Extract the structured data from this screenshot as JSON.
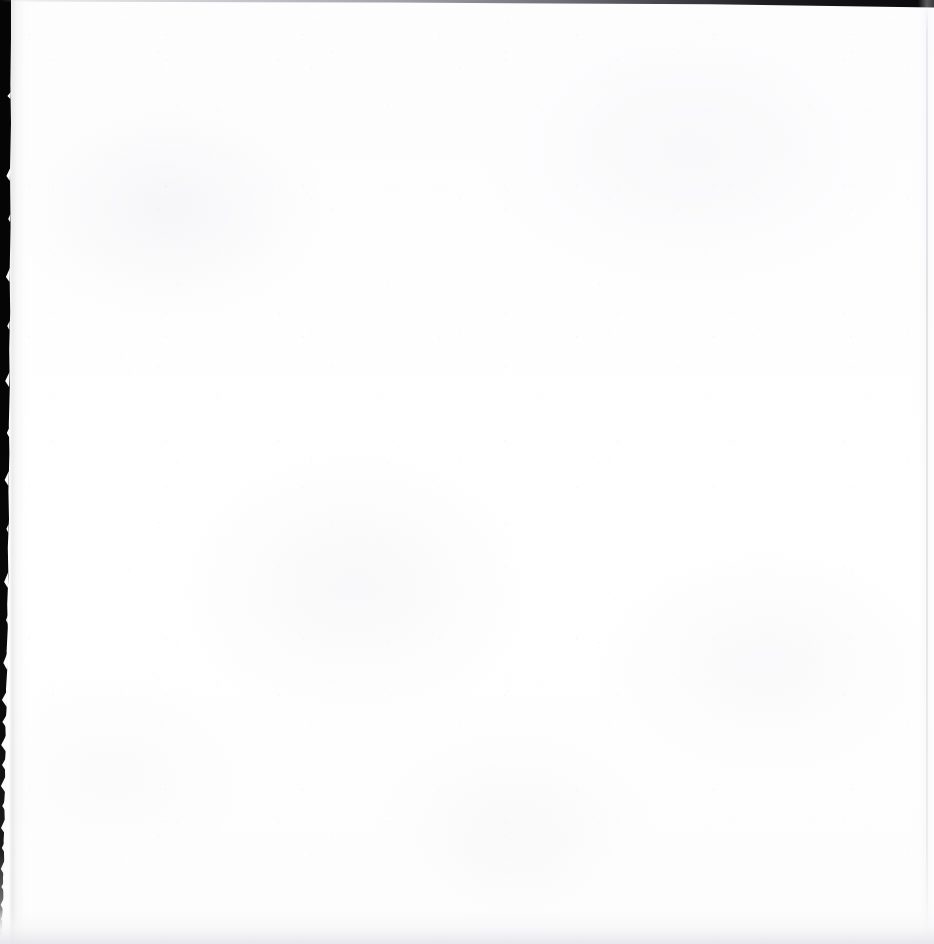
{
  "document": {
    "kind": "scanned-page",
    "page_state": "blank",
    "content_text": "",
    "body_line_count": 0,
    "width_px": 934,
    "height_px": 944
  },
  "page": {
    "paper_color": "#fdfdfe",
    "paper_highlight": "#ffffff",
    "paper_shadow": "#fdfdfd",
    "noise_color": "#cccdd2"
  },
  "artifacts": {
    "gutter": {
      "name": "left-scan-gutter",
      "color": "#050505",
      "fade_color": "#ffffff",
      "edge": "torn",
      "top_width_px": 11,
      "bottom_width_px": 2,
      "fade_start_px": 860,
      "fade_end_px": 930
    },
    "top_edge": {
      "name": "top-scan-edge",
      "color": "#060608",
      "light_color": "#e1e2e6",
      "max_thickness_px": 8,
      "min_thickness_px": 2,
      "darkens_toward": "right"
    },
    "right_line": {
      "name": "right-scan-line",
      "color": "#ced0d6",
      "x_px": 927,
      "thickness_px": 2
    },
    "bottom_shade": {
      "name": "bottom-scan-shadow",
      "color": "#e4e4e9",
      "height_px": 34
    },
    "fibers": {
      "name": "torn-paper-fibers",
      "color": "#fbfbfc",
      "count": 26
    }
  }
}
